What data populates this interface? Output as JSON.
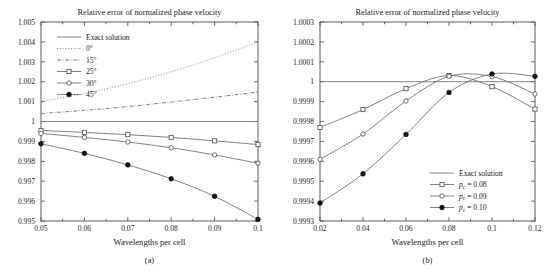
{
  "figure": {
    "caption_a": "(a)",
    "caption_b": "(b)"
  },
  "chart_data": [
    {
      "type": "line",
      "panel": "a",
      "title": "Relative error of normalized phase velocity",
      "xlabel": "Wavelengths per cell",
      "ylabel": "",
      "xlim": [
        0.05,
        0.1
      ],
      "ylim": [
        0.995,
        1.005
      ],
      "xticks": [
        0.05,
        0.06,
        0.07,
        0.08,
        0.09,
        0.1
      ],
      "xticklabels": [
        "0.05",
        "0.06",
        "0.07",
        "0.08",
        "0.09",
        "0.1"
      ],
      "yticks": [
        0.995,
        0.996,
        0.997,
        0.998,
        0.999,
        1.0,
        1.001,
        1.002,
        1.003,
        1.004,
        1.005
      ],
      "yticklabels": [
        "0.995",
        "0.996",
        "0.997",
        "0.998",
        "0.999",
        "1",
        "1.001",
        "1.002",
        "1.003",
        "1.004",
        "1.005"
      ],
      "grid": false,
      "legend_position": "upper-left",
      "series": [
        {
          "name": "Exact solution",
          "style": "solid",
          "marker": "none",
          "x": [
            0.05,
            0.1
          ],
          "values": [
            1.0,
            1.0
          ]
        },
        {
          "name": "0°",
          "style": "dotted",
          "marker": "none",
          "x": [
            0.05,
            0.06,
            0.07,
            0.08,
            0.09,
            0.1
          ],
          "values": [
            1.001,
            1.0014,
            1.0019,
            1.0025,
            1.0032,
            1.004
          ]
        },
        {
          "name": "15°",
          "style": "dashdot",
          "marker": "none",
          "x": [
            0.05,
            0.06,
            0.07,
            0.08,
            0.09,
            0.1
          ],
          "values": [
            1.0004,
            1.00056,
            1.00075,
            1.00098,
            1.00122,
            1.00148
          ]
        },
        {
          "name": "25°",
          "style": "solid",
          "marker": "open-square",
          "x": [
            0.05,
            0.06,
            0.07,
            0.08,
            0.09,
            0.1
          ],
          "values": [
            0.99955,
            0.99945,
            0.99934,
            0.9992,
            0.99903,
            0.99884
          ]
        },
        {
          "name": "30°",
          "style": "solid",
          "marker": "open-circle",
          "x": [
            0.05,
            0.06,
            0.07,
            0.08,
            0.09,
            0.1
          ],
          "values": [
            0.9994,
            0.9992,
            0.99897,
            0.99868,
            0.99832,
            0.9979
          ]
        },
        {
          "name": "45°",
          "style": "solid",
          "marker": "filled-circle",
          "x": [
            0.05,
            0.06,
            0.07,
            0.08,
            0.09,
            0.1
          ],
          "values": [
            0.99888,
            0.9984,
            0.99782,
            0.99712,
            0.99624,
            0.99508
          ]
        }
      ]
    },
    {
      "type": "line",
      "panel": "b",
      "title": "Relative error of normalized phase velocity",
      "xlabel": "Wavelengths per cell",
      "ylabel": "",
      "xlim": [
        0.02,
        0.12
      ],
      "ylim": [
        0.9993,
        1.0003
      ],
      "xticks": [
        0.02,
        0.04,
        0.06,
        0.08,
        0.1,
        0.12
      ],
      "xticklabels": [
        "0.02",
        "0.04",
        "0.06",
        "0.08",
        "0.1",
        "0.12"
      ],
      "yticks": [
        0.9993,
        0.9994,
        0.9995,
        0.9996,
        0.9997,
        0.9998,
        0.9999,
        1.0,
        1.0001,
        1.0002,
        1.0003
      ],
      "yticklabels": [
        "0.9993",
        "0.9994",
        "0.9995",
        "0.9996",
        "0.9997",
        "0.9998",
        "0.9999",
        "1",
        "1.0001",
        "1.0002",
        "1.0003"
      ],
      "grid": false,
      "legend_position": "lower-right",
      "series": [
        {
          "name": "Exact solution",
          "style": "solid",
          "marker": "none",
          "x": [
            0.02,
            0.12
          ],
          "values": [
            1.0,
            1.0
          ]
        },
        {
          "name": "p_c = 0.08",
          "label_html": "<tspan font-style=\"italic\">p</tspan><tspan font-size=\"5.6\" dy=\"1.6\">c</tspan><tspan dy=\"-1.6\"> = 0.08</tspan>",
          "style": "solid",
          "marker": "open-square",
          "x": [
            0.02,
            0.04,
            0.06,
            0.08,
            0.1,
            0.12
          ],
          "values": [
            0.99977,
            0.99986,
            0.999965,
            1.000031,
            0.999975,
            0.999862
          ]
        },
        {
          "name": "p_c = 0.09",
          "label_html": "<tspan font-style=\"italic\">p</tspan><tspan font-size=\"5.6\" dy=\"1.6\">c</tspan><tspan dy=\"-1.6\"> = 0.09</tspan>",
          "style": "solid",
          "marker": "open-circle",
          "x": [
            0.02,
            0.04,
            0.06,
            0.08,
            0.1,
            0.12
          ],
          "values": [
            0.99961,
            0.999737,
            0.999903,
            1.000027,
            1.000026,
            0.999938
          ]
        },
        {
          "name": "p_c = 0.10",
          "label_html": "<tspan font-style=\"italic\">p</tspan><tspan font-size=\"5.6\" dy=\"1.6\">c</tspan><tspan dy=\"-1.6\"> = 0.10</tspan>",
          "style": "solid",
          "marker": "filled-circle",
          "x": [
            0.02,
            0.04,
            0.06,
            0.08,
            0.1,
            0.12
          ],
          "values": [
            0.99939,
            0.999537,
            0.999735,
            0.999946,
            1.000039,
            1.000027
          ]
        }
      ]
    }
  ]
}
